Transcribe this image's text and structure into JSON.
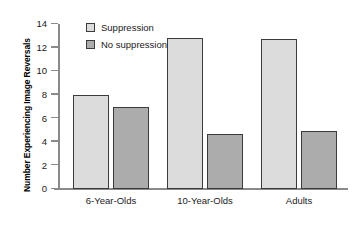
{
  "chart_data": {
    "type": "bar",
    "title": "",
    "xlabel": "",
    "ylabel": "Number Experiencing Image Reversals",
    "categories": [
      "6-Year-Olds",
      "10-Year-Olds",
      "Adults"
    ],
    "series": [
      {
        "name": "Suppression",
        "color": "#dcdcdc",
        "values": [
          8,
          12.8,
          12.7
        ]
      },
      {
        "name": "No suppression",
        "color": "#acacac",
        "values": [
          7,
          4.7,
          4.9
        ]
      }
    ],
    "ylim": [
      0,
      14
    ],
    "yticks": [
      0,
      2,
      4,
      6,
      8,
      10,
      12,
      14
    ],
    "ytick_labels": [
      "0",
      "2",
      "4",
      "6",
      "8",
      "10",
      "12",
      "14"
    ],
    "grid": false,
    "legend_position": "top-left-inside"
  },
  "axes": {
    "y_title": "Number Experiencing Image Reversals"
  },
  "legend": {
    "entries": [
      {
        "label": "Suppression",
        "swatch": "suppression-swatch"
      },
      {
        "label": "No suppression",
        "swatch": "no-suppression-swatch"
      }
    ]
  }
}
